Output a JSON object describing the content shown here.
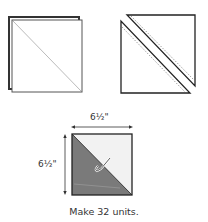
{
  "diagram": {
    "step1": {
      "description": "Two squares layered, diagonal line drawn corner to corner"
    },
    "step2": {
      "description": "Cut along diagonal; seam lines stitched on each side"
    },
    "unit": {
      "width_label": "6½\"",
      "height_label": "6½\"",
      "colors": {
        "dark": "#7a7a7a",
        "light": "#f2f2f2",
        "outline": "#222222"
      }
    },
    "caption": "Make 32 units."
  }
}
